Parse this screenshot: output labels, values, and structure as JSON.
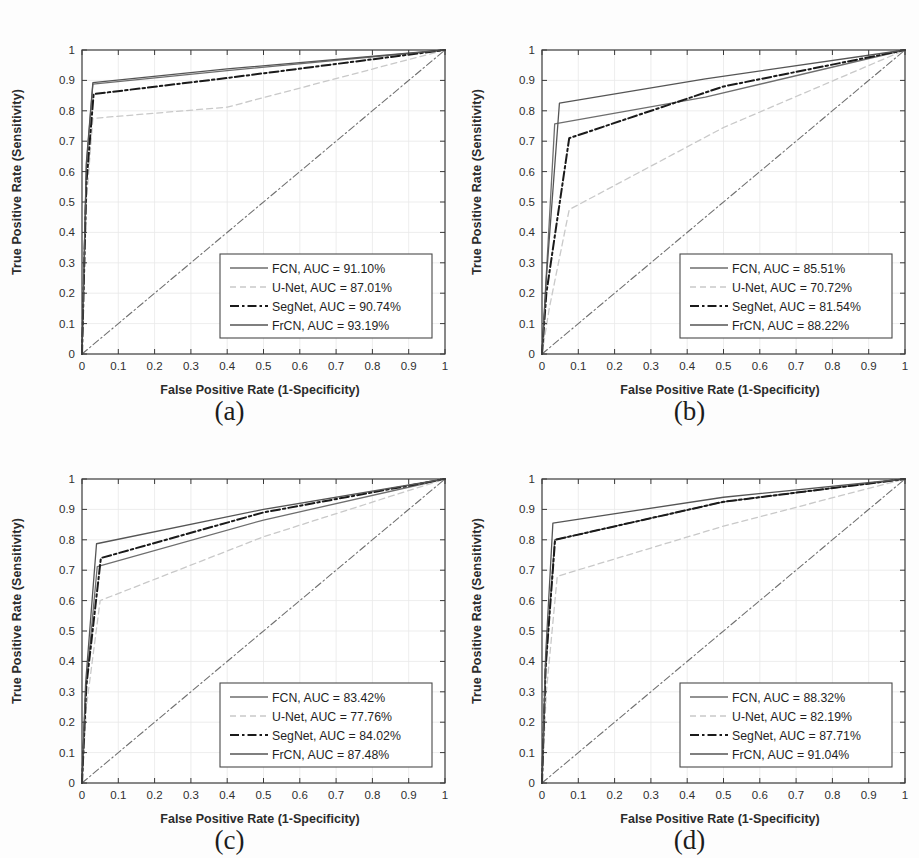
{
  "figure": {
    "background": "#fdfdfd",
    "xlabel": "False Positive Rate (1-Specificity)",
    "ylabel": "True Positive Rate (Sensitivity)",
    "x_ticks": [
      "0",
      "0.1",
      "0.2",
      "0.3",
      "0.4",
      "0.5",
      "0.6",
      "0.7",
      "0.8",
      "0.9",
      "1"
    ],
    "y_ticks": [
      "0",
      "0.1",
      "0.2",
      "0.3",
      "0.4",
      "0.5",
      "0.6",
      "0.7",
      "0.8",
      "0.9",
      "1"
    ],
    "captions": {
      "a": "(a)",
      "b": "(b)",
      "c": "(c)",
      "d": "(d)"
    }
  },
  "colors": {
    "axis": "#3a3a3a",
    "grid": "#e8e8e8",
    "fcn": "#6e6e6e",
    "unet": "#c9c9c9",
    "segnet": "#1a1a1a",
    "frcn": "#555555",
    "chance": "#707070",
    "legend_border": "#4a4a4a",
    "legend_bg": "#ffffff"
  },
  "chart_data": [
    {
      "panel": "a",
      "type": "line",
      "title": "(a)",
      "xlabel": "False Positive Rate (1-Specificity)",
      "ylabel": "True Positive Rate (Sensitivity)",
      "xlim": [
        0,
        1
      ],
      "ylim": [
        0,
        1
      ],
      "grid": true,
      "legend_position": "lower right",
      "series": [
        {
          "name": "FCN",
          "auc": 91.1,
          "legend": "FCN, AUC = 91.10%",
          "style": "solid",
          "color": "#6e6e6e",
          "x": [
            0,
            0.012,
            0.03,
            0.4,
            1
          ],
          "y": [
            0,
            0.62,
            0.888,
            0.932,
            1
          ]
        },
        {
          "name": "U-Net",
          "auc": 87.01,
          "legend": "U-Net, AUC = 87.01%",
          "style": "dashed",
          "color": "#c9c9c9",
          "x": [
            0,
            0.012,
            0.03,
            0.4,
            1
          ],
          "y": [
            0,
            0.5,
            0.775,
            0.812,
            1
          ]
        },
        {
          "name": "SegNet",
          "auc": 90.74,
          "legend": "SegNet, AUC = 90.74%",
          "style": "dashdot",
          "color": "#1a1a1a",
          "x": [
            0,
            0.012,
            0.032,
            0.4,
            1
          ],
          "y": [
            0,
            0.56,
            0.855,
            0.908,
            1
          ]
        },
        {
          "name": "FrCN",
          "auc": 93.19,
          "legend": "FrCN, AUC = 93.19%",
          "style": "solid",
          "color": "#555555",
          "x": [
            0,
            0.012,
            0.03,
            0.4,
            1
          ],
          "y": [
            0,
            0.63,
            0.893,
            0.938,
            1
          ]
        },
        {
          "name": "Chance",
          "legend": "",
          "style": "dashdot",
          "color": "#707070",
          "x": [
            0,
            1
          ],
          "y": [
            0,
            1
          ]
        }
      ]
    },
    {
      "panel": "b",
      "type": "line",
      "title": "(b)",
      "xlabel": "False Positive Rate (1-Specificity)",
      "ylabel": "True Positive Rate (Sensitivity)",
      "xlim": [
        0,
        1
      ],
      "ylim": [
        0,
        1
      ],
      "grid": true,
      "legend_position": "lower right",
      "series": [
        {
          "name": "FCN",
          "auc": 85.51,
          "legend": "FCN, AUC = 85.51%",
          "style": "solid",
          "color": "#6e6e6e",
          "x": [
            0,
            0.01,
            0.035,
            0.45,
            1
          ],
          "y": [
            0,
            0.22,
            0.757,
            0.845,
            1
          ]
        },
        {
          "name": "U-Net",
          "auc": 70.72,
          "legend": "U-Net, AUC = 70.72%",
          "style": "dashed",
          "color": "#c9c9c9",
          "x": [
            0,
            0.02,
            0.075,
            0.5,
            1
          ],
          "y": [
            0,
            0.15,
            0.475,
            0.745,
            1
          ]
        },
        {
          "name": "SegNet",
          "auc": 81.54,
          "legend": "SegNet, AUC = 81.54%",
          "style": "dashdot",
          "color": "#1a1a1a",
          "x": [
            0,
            0.012,
            0.075,
            0.5,
            1
          ],
          "y": [
            0,
            0.2,
            0.71,
            0.88,
            1
          ]
        },
        {
          "name": "FrCN",
          "auc": 88.22,
          "legend": "FrCN, AUC = 88.22%",
          "style": "solid",
          "color": "#555555",
          "x": [
            0,
            0.012,
            0.048,
            0.45,
            1
          ],
          "y": [
            0,
            0.25,
            0.825,
            0.905,
            1
          ]
        },
        {
          "name": "Chance",
          "legend": "",
          "style": "dashdot",
          "color": "#707070",
          "x": [
            0,
            1
          ],
          "y": [
            0,
            1
          ]
        }
      ]
    },
    {
      "panel": "c",
      "type": "line",
      "title": "(c)",
      "xlabel": "False Positive Rate (1-Specificity)",
      "ylabel": "True Positive Rate (Sensitivity)",
      "xlim": [
        0,
        1
      ],
      "ylim": [
        0,
        1
      ],
      "grid": true,
      "legend_position": "lower right",
      "series": [
        {
          "name": "FCN",
          "auc": 83.42,
          "legend": "FCN, AUC = 83.42%",
          "style": "solid",
          "color": "#6e6e6e",
          "x": [
            0,
            0.01,
            0.042,
            0.5,
            1
          ],
          "y": [
            0,
            0.3,
            0.712,
            0.865,
            1
          ]
        },
        {
          "name": "U-Net",
          "auc": 77.76,
          "legend": "U-Net, AUC = 77.76%",
          "style": "dashed",
          "color": "#c9c9c9",
          "x": [
            0,
            0.012,
            0.05,
            0.5,
            1
          ],
          "y": [
            0,
            0.25,
            0.6,
            0.81,
            1
          ]
        },
        {
          "name": "SegNet",
          "auc": 84.02,
          "legend": "SegNet, AUC = 84.02%",
          "style": "dashdot",
          "color": "#1a1a1a",
          "x": [
            0,
            0.012,
            0.052,
            0.5,
            1
          ],
          "y": [
            0,
            0.32,
            0.74,
            0.89,
            1
          ]
        },
        {
          "name": "FrCN",
          "auc": 87.48,
          "legend": "FrCN, AUC = 87.48%",
          "style": "solid",
          "color": "#555555",
          "x": [
            0,
            0.01,
            0.04,
            0.5,
            1
          ],
          "y": [
            0,
            0.33,
            0.787,
            0.9,
            1
          ]
        },
        {
          "name": "Chance",
          "legend": "",
          "style": "dashdot",
          "color": "#707070",
          "x": [
            0,
            1
          ],
          "y": [
            0,
            1
          ]
        }
      ]
    },
    {
      "panel": "d",
      "type": "line",
      "title": "(d)",
      "xlabel": "False Positive Rate (1-Specificity)",
      "ylabel": "True Positive Rate (Sensitivity)",
      "xlim": [
        0,
        1
      ],
      "ylim": [
        0,
        1
      ],
      "grid": true,
      "legend_position": "lower right",
      "series": [
        {
          "name": "FCN",
          "auc": 88.32,
          "legend": "FCN, AUC = 88.32%",
          "style": "solid",
          "color": "#6e6e6e",
          "x": [
            0,
            0.01,
            0.035,
            0.5,
            1
          ],
          "y": [
            0,
            0.38,
            0.8,
            0.925,
            1
          ]
        },
        {
          "name": "U-Net",
          "auc": 82.19,
          "legend": "U-Net, AUC = 82.19%",
          "style": "dashed",
          "color": "#c9c9c9",
          "x": [
            0,
            0.012,
            0.042,
            0.5,
            1
          ],
          "y": [
            0,
            0.3,
            0.68,
            0.845,
            1
          ]
        },
        {
          "name": "SegNet",
          "auc": 87.71,
          "legend": "SegNet, AUC = 87.71%",
          "style": "dashdot",
          "color": "#1a1a1a",
          "x": [
            0,
            0.01,
            0.036,
            0.5,
            1
          ],
          "y": [
            0,
            0.38,
            0.8,
            0.925,
            1
          ]
        },
        {
          "name": "FrCN",
          "auc": 91.04,
          "legend": "FrCN, AUC = 91.04%",
          "style": "solid",
          "color": "#555555",
          "x": [
            0,
            0.01,
            0.03,
            0.5,
            1
          ],
          "y": [
            0,
            0.42,
            0.855,
            0.94,
            1
          ]
        },
        {
          "name": "Chance",
          "legend": "",
          "style": "dashdot",
          "color": "#707070",
          "x": [
            0,
            1
          ],
          "y": [
            0,
            1
          ]
        }
      ]
    }
  ]
}
